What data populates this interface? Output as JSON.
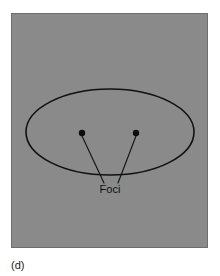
{
  "figure": {
    "caption": "(d)",
    "panel": {
      "name": "ellipse-panel",
      "background_color": "#8a8a8a",
      "border_color": "#6e6e6e",
      "x": 11,
      "y": 13,
      "width": 197,
      "height": 235
    },
    "ellipse": {
      "name": "ellipse-outline",
      "center_x": 110,
      "center_y": 132,
      "radius_x": 84,
      "radius_y": 43,
      "stroke_color": "#111111"
    },
    "foci": {
      "label": "Foci",
      "label_x": 110,
      "label_y": 193,
      "color": "#0d0d0d",
      "points": [
        {
          "name": "left-focus",
          "x": 82,
          "y": 133,
          "radius": 3.2
        },
        {
          "name": "right-focus",
          "x": 136,
          "y": 133,
          "radius": 3.2
        }
      ],
      "leader_lines": [
        {
          "name": "left-leader-line",
          "x1": 82,
          "y1": 136,
          "x2": 104,
          "y2": 183
        },
        {
          "name": "right-leader-line",
          "x1": 136,
          "y1": 136,
          "x2": 118,
          "y2": 183
        }
      ]
    }
  }
}
